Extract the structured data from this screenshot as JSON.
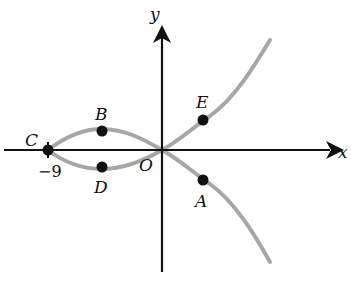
{
  "diagram": {
    "axes": {
      "x_label": "x",
      "y_label": "y",
      "origin_label": "O"
    },
    "tick_labels": {
      "minus_nine": "−9"
    },
    "points": [
      {
        "name": "A",
        "label": "A"
      },
      {
        "name": "B",
        "label": "B"
      },
      {
        "name": "C",
        "label": "C"
      },
      {
        "name": "D",
        "label": "D"
      },
      {
        "name": "E",
        "label": "E"
      }
    ],
    "colors": {
      "curve": "#a6a6a6",
      "axes": "#111111",
      "points": "#111111"
    }
  }
}
